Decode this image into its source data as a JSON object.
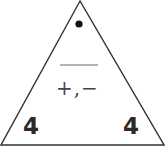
{
  "diagram": {
    "type": "fact-family-triangle",
    "top": {
      "symbol": "•",
      "meaning": "unknown (dot)"
    },
    "divider": "line",
    "operations": "+,−",
    "bottom_left": "4",
    "bottom_right": "4"
  },
  "colors": {
    "stroke": "#333333",
    "text": "#2a2a2a",
    "divider": "#999999"
  }
}
